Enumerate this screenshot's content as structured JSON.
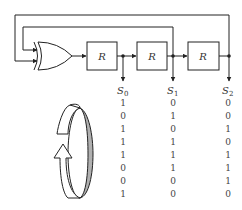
{
  "diagram": {
    "registers": [
      {
        "label": "R"
      },
      {
        "label": "R"
      },
      {
        "label": "R"
      }
    ],
    "gate": "XOR",
    "outputs": [
      {
        "name": "S",
        "sub": "0"
      },
      {
        "name": "S",
        "sub": "1"
      },
      {
        "name": "S",
        "sub": "2"
      }
    ],
    "sequence": {
      "columns": [
        "S0",
        "S1",
        "S2"
      ],
      "rows": [
        [
          "1",
          "0",
          "0"
        ],
        [
          "0",
          "1",
          "0"
        ],
        [
          "1",
          "0",
          "1"
        ],
        [
          "1",
          "1",
          "0"
        ],
        [
          "1",
          "1",
          "1"
        ],
        [
          "0",
          "1",
          "1"
        ],
        [
          "0",
          "0",
          "1"
        ],
        [
          "1",
          "0",
          "0"
        ]
      ]
    },
    "cycle_icon": "circular-arrow-icon",
    "colors": {
      "line": "#222222",
      "ring_shade": "#b0b0b0"
    }
  }
}
